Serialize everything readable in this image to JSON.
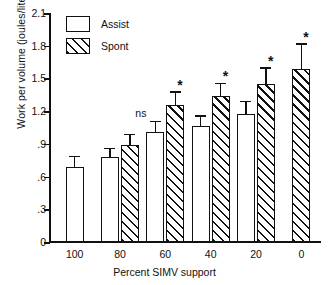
{
  "chart_data": {
    "type": "bar",
    "title": "",
    "xlabel": "Percent SIMV support",
    "ylabel": "Work per volume (joules/liter)",
    "categories": [
      "100",
      "80",
      "60",
      "40",
      "20",
      "0"
    ],
    "ylim": [
      0,
      2.1
    ],
    "yticks": [
      "0",
      ".3",
      ".6",
      ".9",
      "1.2",
      "1.5",
      "1.8",
      "2.1"
    ],
    "ytick_values": [
      0,
      0.3,
      0.6,
      0.9,
      1.2,
      1.5,
      1.8,
      2.1
    ],
    "grid": false,
    "legend_position": "top-left",
    "series": [
      {
        "name": "Assist",
        "fill": "open",
        "values": [
          0.69,
          0.78,
          1.01,
          1.06,
          1.17,
          null
        ],
        "errors": [
          0.09,
          0.07,
          0.09,
          0.09,
          0.11,
          null
        ]
      },
      {
        "name": "Spont",
        "fill": "hatched",
        "values": [
          null,
          0.89,
          1.26,
          1.34,
          1.45,
          1.59
        ],
        "errors": [
          null,
          0.09,
          0.11,
          0.11,
          0.14,
          0.22
        ]
      }
    ],
    "annotations": [
      {
        "text": "ns",
        "category": "60",
        "series": "Assist"
      },
      {
        "text": "*",
        "category": "60",
        "series": "Spont"
      },
      {
        "text": "*",
        "category": "40",
        "series": "Spont"
      },
      {
        "text": "*",
        "category": "20",
        "series": "Spont"
      },
      {
        "text": "*",
        "category": "0",
        "series": "Spont"
      }
    ],
    "colors": {
      "line": "#111111",
      "background": "#ffffff"
    }
  },
  "legend": {
    "items": [
      {
        "label": "Assist"
      },
      {
        "label": "Spont"
      }
    ]
  }
}
